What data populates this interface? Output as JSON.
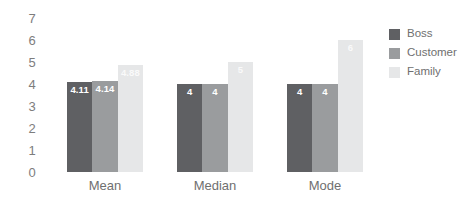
{
  "chart_data": {
    "type": "bar",
    "title": "",
    "subtitle": "",
    "xlabel": "",
    "ylabel": "",
    "categories": [
      "Mean",
      "Median",
      "Mode"
    ],
    "series": [
      {
        "name": "Boss",
        "color": "#5f6063",
        "values": [
          4.11,
          4,
          4
        ],
        "labels": [
          "4.11",
          "4",
          "4"
        ]
      },
      {
        "name": "Customer",
        "color": "#9a9c9e",
        "values": [
          4.14,
          4,
          4
        ],
        "labels": [
          "4.14",
          "4",
          "4"
        ]
      },
      {
        "name": "Family",
        "color": "#e6e7e8",
        "values": [
          4.88,
          5,
          6
        ],
        "labels": [
          "4.88",
          "5",
          "6"
        ]
      }
    ],
    "ylim": [
      0,
      7
    ],
    "yticks": [
      "0",
      "1",
      "2",
      "3",
      "4",
      "5",
      "6",
      "7"
    ],
    "grid": false,
    "legend_position": "right",
    "background": "#ffffff",
    "tick_color": "#7d7d7d",
    "label_color": "#6f6f6f"
  }
}
